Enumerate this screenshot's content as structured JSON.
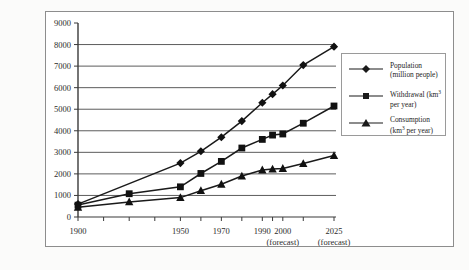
{
  "chart_data": {
    "type": "line",
    "title": "",
    "xlabel": "",
    "ylabel": "",
    "ylim": [
      0,
      9000
    ],
    "yticks": [
      0,
      1000,
      2000,
      3000,
      4000,
      5000,
      6000,
      7000,
      8000,
      9000
    ],
    "grid": true,
    "legend_position": "right",
    "x_tick_labels": [
      "1900",
      "",
      "1950",
      "",
      "1970",
      "",
      "1990",
      "",
      "2000",
      "2025"
    ],
    "x_tick_sublabels": [
      "",
      "",
      "",
      "",
      "",
      "",
      "",
      "",
      "(forecast)",
      "(forecast)"
    ],
    "categories": [
      "1900",
      "1925",
      "1950",
      "1960",
      "1970",
      "1980",
      "1990",
      "1995",
      "2000",
      "2010",
      "2025"
    ],
    "series": [
      {
        "name": "Population (million people)",
        "label_line1": "Population",
        "label_line2": "(million people)",
        "marker": "diamond",
        "color": "#1a1a1a",
        "x": [
          1900,
          1925,
          1950,
          1960,
          1970,
          1980,
          1990,
          1995,
          2000,
          2010,
          2025
        ],
        "values": [
          600,
          null,
          2500,
          3050,
          3700,
          4450,
          5300,
          5700,
          6100,
          7050,
          7900
        ]
      },
      {
        "name": "Withdrawal (km3 per year)",
        "label_line1": "Withdrawal (km",
        "label_sup": "3",
        "label_line2": "per year)",
        "marker": "square",
        "color": "#1a1a1a",
        "x": [
          1900,
          1925,
          1950,
          1960,
          1970,
          1980,
          1990,
          1995,
          2000,
          2010,
          2025
        ],
        "values": [
          550,
          1080,
          1400,
          2020,
          2580,
          3200,
          3600,
          3800,
          3850,
          4350,
          5150
        ]
      },
      {
        "name": "Consumption (km3 per year)",
        "label_line1": "Consumption",
        "label_line2": "(km",
        "label_sup": "3",
        "label_line2b": " per year)",
        "marker": "triangle",
        "color": "#1a1a1a",
        "x": [
          1900,
          1925,
          1950,
          1960,
          1970,
          1980,
          1990,
          1995,
          2000,
          2010,
          2025
        ],
        "values": [
          450,
          700,
          900,
          1220,
          1520,
          1900,
          2180,
          2220,
          2250,
          2480,
          2850
        ]
      }
    ]
  },
  "axis": {
    "y_labels": [
      "9000",
      "8000",
      "7000",
      "6000",
      "5000",
      "4000",
      "3000",
      "2000",
      "1000",
      "0"
    ],
    "x_labels": [
      {
        "main": "1900",
        "sub": ""
      },
      {
        "main": "1950",
        "sub": ""
      },
      {
        "main": "1970",
        "sub": ""
      },
      {
        "main": "1990",
        "sub": ""
      },
      {
        "main": "2000",
        "sub": "(forecast)"
      },
      {
        "main": "2025",
        "sub": "(forecast)"
      }
    ]
  },
  "legend": {
    "items": [
      {
        "line1": "Population",
        "line2": "(million people)",
        "marker": "diamond-marker-icon"
      },
      {
        "line1": "Withdrawal (km",
        "sup": "3",
        "line1b": "",
        "line2": "per year)",
        "marker": "square-marker-icon"
      },
      {
        "line1": "Consumption",
        "line2a": "(km",
        "sup": "3",
        "line2b": " per year)",
        "marker": "triangle-marker-icon"
      }
    ]
  }
}
